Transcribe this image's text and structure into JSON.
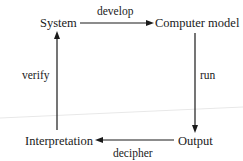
{
  "diagram": {
    "nodes": [
      {
        "id": "system",
        "label": "System"
      },
      {
        "id": "computer_model",
        "label": "Computer model"
      },
      {
        "id": "output",
        "label": "Output"
      },
      {
        "id": "interpretation",
        "label": "Interpretation"
      }
    ],
    "edges": [
      {
        "from": "system",
        "to": "computer_model",
        "label": "develop"
      },
      {
        "from": "computer_model",
        "to": "output",
        "label": "run"
      },
      {
        "from": "output",
        "to": "interpretation",
        "label": "decipher"
      },
      {
        "from": "interpretation",
        "to": "system",
        "label": "verify"
      }
    ]
  },
  "colors": {
    "stroke": "#1a1a1a",
    "background": "#ffffff",
    "artifact_line": "#e6e6e6"
  }
}
